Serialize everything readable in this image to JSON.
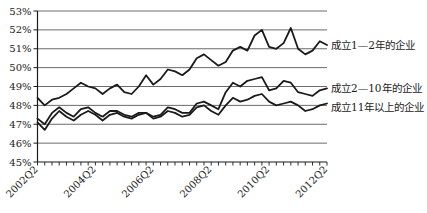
{
  "chart_data": {
    "type": "line",
    "title": "",
    "xlabel": "",
    "ylabel": "",
    "ylim": [
      45,
      53
    ],
    "y_tick_step": 1,
    "y_tick_format": "percent",
    "y_tick_labels": [
      "53%",
      "52%",
      "51%",
      "50%",
      "49%",
      "48%",
      "47%",
      "46%",
      "45%"
    ],
    "x_tick_labels_shown": [
      "2002Q2",
      "2004Q2",
      "2006Q2",
      "2008Q2",
      "2010Q2",
      "2012Q2"
    ],
    "x_label_interval": 8,
    "grid": true,
    "line_color": "#1a1a1a",
    "grid_color": "#5a5a5a",
    "legend_position": "right of line ends",
    "x": [
      "2002Q2",
      "2002Q3",
      "2002Q4",
      "2003Q1",
      "2003Q2",
      "2003Q3",
      "2003Q4",
      "2004Q1",
      "2004Q2",
      "2004Q3",
      "2004Q4",
      "2005Q1",
      "2005Q2",
      "2005Q3",
      "2005Q4",
      "2006Q1",
      "2006Q2",
      "2006Q3",
      "2006Q4",
      "2007Q1",
      "2007Q2",
      "2007Q3",
      "2007Q4",
      "2008Q1",
      "2008Q2",
      "2008Q3",
      "2008Q4",
      "2009Q1",
      "2009Q2",
      "2009Q3",
      "2009Q4",
      "2010Q1",
      "2010Q2",
      "2010Q3",
      "2010Q4",
      "2011Q1",
      "2011Q2",
      "2011Q3",
      "2011Q4",
      "2012Q1",
      "2012Q2"
    ],
    "series": [
      {
        "name": "成立1—2年的企业",
        "values": [
          48.4,
          48.0,
          48.3,
          48.4,
          48.6,
          48.9,
          49.2,
          49.0,
          48.9,
          48.6,
          48.9,
          49.1,
          48.7,
          48.6,
          49.0,
          49.6,
          49.1,
          49.4,
          49.9,
          49.8,
          49.6,
          49.9,
          50.5,
          50.7,
          50.4,
          50.1,
          50.3,
          50.9,
          51.1,
          50.9,
          51.7,
          52.0,
          51.1,
          51.0,
          51.3,
          52.1,
          51.0,
          50.7,
          50.9,
          51.4,
          51.2
        ]
      },
      {
        "name": "成立2—10年的企业",
        "values": [
          47.3,
          47.0,
          47.6,
          47.9,
          47.6,
          47.4,
          47.8,
          47.9,
          47.6,
          47.4,
          47.7,
          47.7,
          47.5,
          47.4,
          47.6,
          47.6,
          47.4,
          47.5,
          47.9,
          47.8,
          47.6,
          47.6,
          48.1,
          48.2,
          48.0,
          47.8,
          48.7,
          49.2,
          49.0,
          49.3,
          49.4,
          49.5,
          48.8,
          48.9,
          49.3,
          49.2,
          48.7,
          48.6,
          48.5,
          48.8,
          48.9
        ]
      },
      {
        "name": "成立11年以上的企业",
        "values": [
          47.1,
          46.7,
          47.3,
          47.7,
          47.4,
          47.2,
          47.5,
          47.7,
          47.5,
          47.2,
          47.5,
          47.6,
          47.4,
          47.3,
          47.5,
          47.6,
          47.3,
          47.4,
          47.7,
          47.6,
          47.4,
          47.5,
          47.9,
          48.0,
          47.7,
          47.5,
          48.0,
          48.4,
          48.2,
          48.3,
          48.5,
          48.6,
          48.2,
          48.0,
          48.1,
          48.2,
          48.0,
          47.7,
          47.8,
          48.0,
          48.1
        ]
      }
    ]
  }
}
